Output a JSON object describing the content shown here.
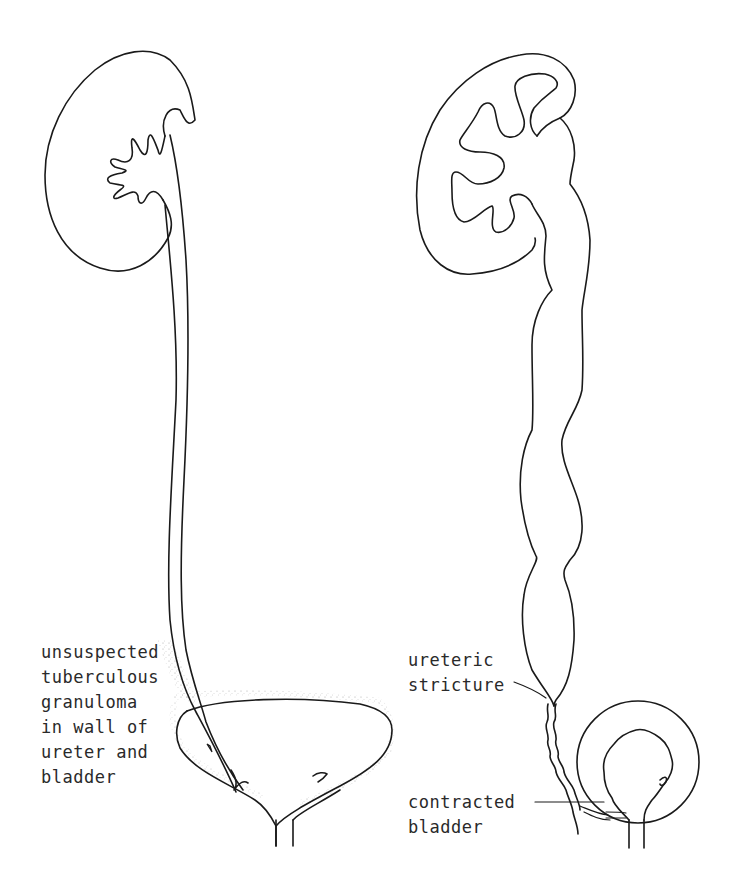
{
  "figure": {
    "left_panel": {
      "description": "normal-size kidney with thin ureter entering a normal bladder",
      "annotation": {
        "lines": [
          "unsuspected",
          "tuberculous",
          "granuloma",
          "in wall of",
          "ureter and",
          "bladder"
        ]
      }
    },
    "right_panel": {
      "description": "hydronephrotic kidney with dilated tortuous ureter, stricture, and contracted bladder",
      "annotations": [
        {
          "id": "ureteric-stricture",
          "lines": [
            "ureteric",
            "stricture"
          ]
        },
        {
          "id": "contracted-bladder",
          "lines": [
            "contracted",
            "bladder"
          ]
        }
      ]
    },
    "colors": {
      "line": "#1a1a1a",
      "text": "#2a2a2a",
      "stipple": "#9a9a9a",
      "background": "#ffffff"
    }
  }
}
